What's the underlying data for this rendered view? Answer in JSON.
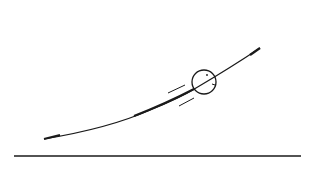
{
  "diagram": {
    "type": "line-drawing",
    "colors": {
      "background": "#ffffff",
      "stroke": "#1a1a1a"
    },
    "elements": {
      "ground_line": {
        "x1": 14,
        "y1": 156,
        "x2": 301,
        "y2": 156
      },
      "trajectory": {
        "start": [
          44,
          139
        ],
        "control": [
          140,
          118
        ],
        "end": [
          260,
          48
        ]
      },
      "ball": {
        "cx": 204,
        "cy": 82,
        "r": 12
      },
      "motion_lines": [
        {
          "x1": 168,
          "y1": 93,
          "x2": 185,
          "y2": 85
        },
        {
          "x1": 179,
          "y1": 106,
          "x2": 194,
          "y2": 98
        }
      ]
    }
  }
}
